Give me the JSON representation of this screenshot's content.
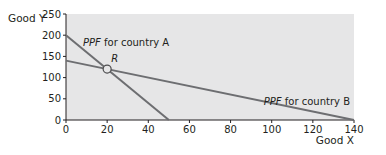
{
  "chart_data": {
    "type": "line",
    "title": "",
    "xlabel": "Good X",
    "ylabel": "Good Y",
    "xlim": [
      0,
      140
    ],
    "ylim": [
      0,
      250
    ],
    "x_ticks": [
      0,
      20,
      40,
      60,
      80,
      100,
      120,
      140
    ],
    "y_ticks": [
      0,
      50,
      100,
      150,
      200,
      250
    ],
    "grid": false,
    "series": [
      {
        "name": "PPF for country A",
        "x": [
          0,
          50
        ],
        "y": [
          200,
          0
        ]
      },
      {
        "name": "PPF for country B",
        "x": [
          0,
          140
        ],
        "y": [
          140,
          0
        ]
      }
    ],
    "annotations": [
      {
        "label": "R",
        "x": 20,
        "y": 120,
        "marker": "open-circle"
      }
    ],
    "labels": {
      "series_a_prefix": "PPF",
      "series_a_suffix": " for country A",
      "series_b_prefix": "PPF",
      "series_b_suffix": " for country B"
    },
    "colors": {
      "plot_background": "#e6e6e7",
      "line": "#6d6e71",
      "axis": "#231f20"
    }
  }
}
